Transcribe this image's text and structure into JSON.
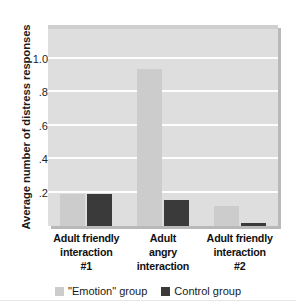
{
  "chart_data": {
    "type": "bar",
    "title": "",
    "subtitle": "",
    "xlabel": "",
    "ylabel": "Average number of distress responses",
    "categories": [
      "Adult friendly interaction #1",
      "Adult angry interaction",
      "Adult friendly interaction #2"
    ],
    "category_lines": [
      [
        "Adult friendly",
        "interaction",
        "#1"
      ],
      [
        "Adult",
        "angry",
        "interaction"
      ],
      [
        "Adult friendly",
        "interaction",
        "#2"
      ]
    ],
    "series": [
      {
        "name": "\"Emotion\" group",
        "color": "#cccccc",
        "values": [
          0.19,
          0.935,
          0.12
        ]
      },
      {
        "name": "Control group",
        "color": "#3a3a3a",
        "values": [
          0.19,
          0.155,
          0.02
        ]
      }
    ],
    "ylim": [
      0,
      1.2
    ],
    "yticks": [
      1.0,
      0.8,
      0.6,
      0.4,
      0.2
    ],
    "ytick_labels": [
      "1.0",
      ".8",
      ".6",
      ".4",
      ".2"
    ],
    "grid": true,
    "grid_axis": "y",
    "legend_position": "bottom",
    "plot_background": "#dedede",
    "gridline_color": "#fdfdfd"
  },
  "legend": {
    "items": [
      {
        "label": "\"Emotion\" group",
        "swatch": "emotion"
      },
      {
        "label": "Control group",
        "swatch": "control"
      }
    ]
  }
}
